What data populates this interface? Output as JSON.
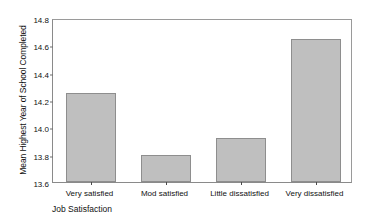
{
  "chart_data": {
    "type": "bar",
    "title": "",
    "subtitle": "",
    "categories": [
      "Very satisfied",
      "Mod satisfied",
      "Little dissatisfied",
      "Very dissatisfied"
    ],
    "values": [
      14.25,
      13.8,
      13.92,
      14.65
    ],
    "xlabel": "Job Satisfaction",
    "ylabel": "Mean Highest Year of School Completed",
    "ylim": [
      13.6,
      14.8
    ],
    "ytick_labels": [
      "13.6",
      "13.8",
      "14.0",
      "14.2",
      "14.4",
      "14.6",
      "14.8"
    ],
    "ytick_values": [
      13.6,
      13.8,
      14.0,
      14.2,
      14.4,
      14.6,
      14.8
    ],
    "grid": false,
    "legend": false,
    "legend_position": "none",
    "bar_color": "#bfbfbf",
    "bar_edge_color": "#8e8e8e",
    "axis_color": "#8a8a8a",
    "background_color": "#ffffff"
  }
}
